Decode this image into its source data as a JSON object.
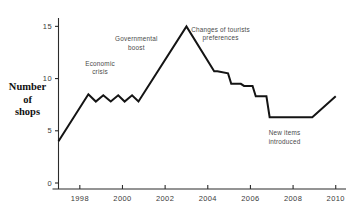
{
  "chart_data": {
    "type": "line",
    "title": "",
    "subtitle": "",
    "xlabel": "",
    "ylabel": "Number of shops",
    "ylabel_lines": [
      "Number",
      "of",
      "shops"
    ],
    "xlim": [
      1997,
      2010.2
    ],
    "ylim": [
      0,
      15.8
    ],
    "grid": false,
    "legend": null,
    "y_ticks": [
      0,
      5,
      10,
      15
    ],
    "y_tick_labels": [
      "0",
      "5",
      "10",
      "15"
    ],
    "x_ticks": [
      1998,
      2000,
      2002,
      2004,
      2006,
      2008,
      2010
    ],
    "x_tick_labels": [
      "1998",
      "2000",
      "2002",
      "2004",
      "2006",
      "2008",
      "2010"
    ],
    "series": [
      {
        "name": "Number of shops",
        "color": "#141414",
        "x": [
          1997.0,
          1998.4,
          1998.75,
          1999.1,
          1999.45,
          1999.8,
          2000.1,
          2000.45,
          2000.75,
          2003.0,
          2004.3,
          2004.45,
          2004.95,
          2005.1,
          2005.55,
          2005.7,
          2006.1,
          2006.25,
          2006.75,
          2006.9,
          2008.9,
          2010.0
        ],
        "y": [
          4.0,
          8.5,
          7.8,
          8.4,
          7.8,
          8.4,
          7.8,
          8.4,
          7.8,
          15.0,
          10.7,
          10.7,
          10.5,
          9.5,
          9.5,
          9.3,
          9.3,
          8.3,
          8.3,
          6.3,
          6.3,
          8.3
        ]
      }
    ],
    "annotations": [
      {
        "id": "economic-crisis",
        "lines": [
          "Economic",
          "crisis"
        ],
        "x": 1998.95,
        "y": 11.2
      },
      {
        "id": "governmental-boost",
        "lines": [
          "Governmental",
          "boost"
        ],
        "x": 2000.65,
        "y": 13.55
      },
      {
        "id": "changes-of-tourists-preferences",
        "lines": [
          "Changes of tourists",
          "preferences"
        ],
        "x": 2004.6,
        "y": 14.45
      },
      {
        "id": "new-items-introduced",
        "lines": [
          "New items",
          "introduced"
        ],
        "x": 2007.6,
        "y": 4.55
      }
    ]
  }
}
